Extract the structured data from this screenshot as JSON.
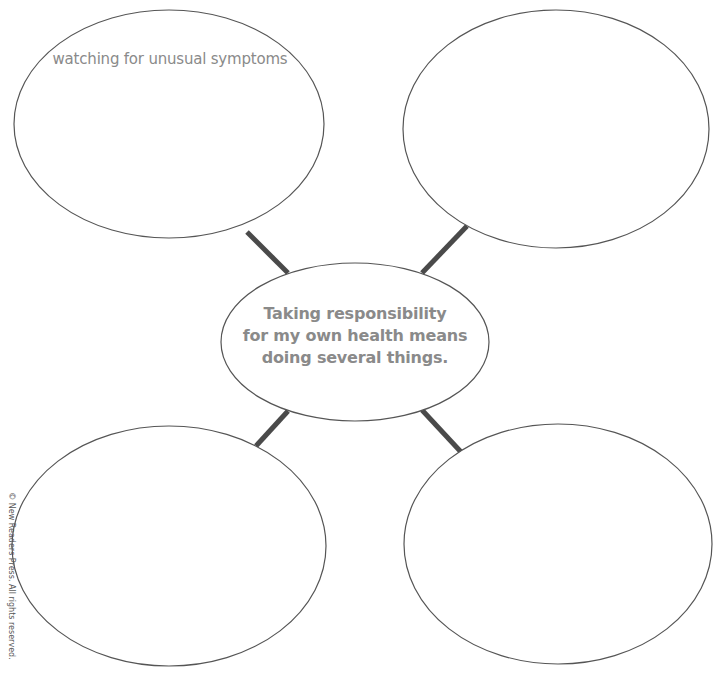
{
  "diagram": {
    "type": "idea-web",
    "center": {
      "text_lines": [
        "Taking responsibility",
        "for my own health means",
        "doing several things."
      ]
    },
    "bubbles": [
      {
        "position": "top-left",
        "text": "watching for unusual symptoms"
      },
      {
        "position": "top-right",
        "text": ""
      },
      {
        "position": "bottom-left",
        "text": ""
      },
      {
        "position": "bottom-right",
        "text": ""
      }
    ],
    "colors": {
      "outline": "#555555",
      "connector": "#4a4a4a",
      "text": "#8a8a8a"
    }
  },
  "footer": {
    "copyright": "© New Readers Press. All rights reserved."
  }
}
